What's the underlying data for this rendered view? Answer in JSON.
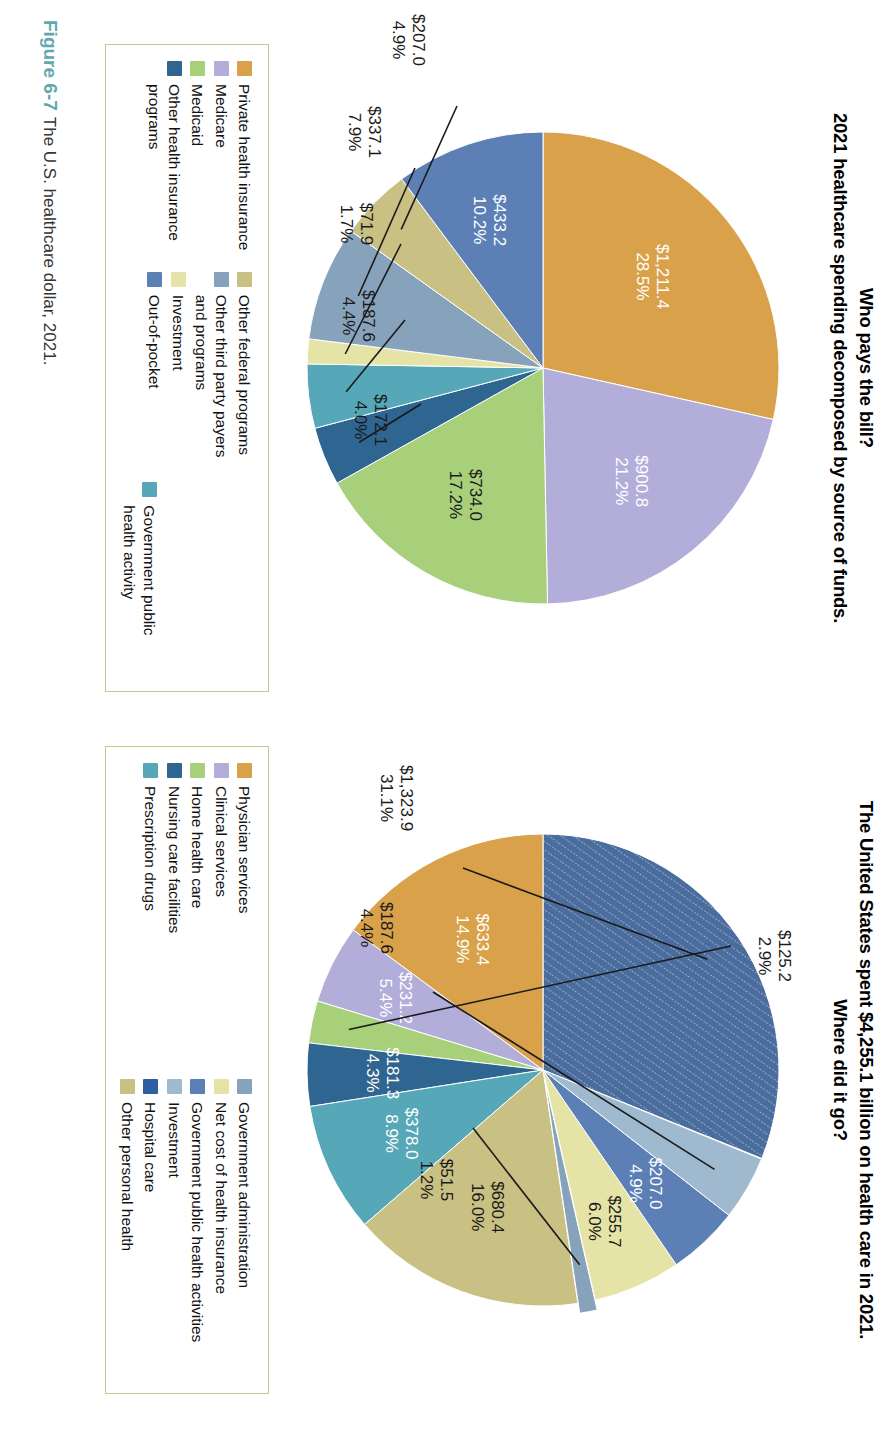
{
  "figure": {
    "number": "Figure 6-7",
    "caption": "The U.S. healthcare dollar, 2021."
  },
  "left_panel": {
    "title_line1": "Who pays the bill?",
    "title_line2": "2021 healthcare spending decomposed by source of funds.",
    "legend": {
      "column1": [
        {
          "label": "Private health insurance",
          "color": "#d9a14a"
        },
        {
          "label": "Medicare",
          "color": "#b3adda"
        },
        {
          "label": "Medicaid",
          "color": "#a8d07a"
        },
        {
          "label": "Other health insurance\nprograms",
          "color": "#2e6591"
        }
      ],
      "column2": [
        {
          "label": "Other federal programs",
          "color": "#c9c083"
        },
        {
          "label": "Other third party payers\nand programs",
          "color": "#87a2bb"
        },
        {
          "label": "Investment",
          "color": "#e5e3a6"
        },
        {
          "label": "Out-of-pocket",
          "color": "#5c7fb5"
        }
      ],
      "column3": [
        {
          "label": "Government public health activity",
          "color": "#56a8b8"
        }
      ]
    }
  },
  "right_panel": {
    "title_line1": "The United States spent $4,255.1 billion on health care in 2021.",
    "title_line2": "Where did it go?",
    "legend": {
      "column1": [
        {
          "label": "Physician services",
          "color": "#d9a14a"
        },
        {
          "label": "Clinical services",
          "color": "#b3adda"
        },
        {
          "label": "Home health care",
          "color": "#a8d07a"
        },
        {
          "label": "Nursing care facilities",
          "color": "#2e6591"
        },
        {
          "label": "Prescription drugs",
          "color": "#56a8b8"
        }
      ],
      "column2": [
        {
          "label": "Government administration",
          "color": "#87a2bb"
        },
        {
          "label": "Net cost of health insurance",
          "color": "#e5e3a6"
        },
        {
          "label": "Government public health activities",
          "color": "#5c7fb5"
        },
        {
          "label": "Investment",
          "color": "#9fb9cf"
        },
        {
          "label": "Hospital care",
          "color": "#2f5fa3"
        },
        {
          "label": "Other personal health",
          "color": "#c9c083"
        }
      ]
    }
  },
  "chart_data": [
    {
      "type": "pie",
      "id": "who-pays-the-bill",
      "title": "Who pays the bill? 2021 healthcare spending decomposed by source of funds.",
      "total": 4255.1,
      "units": "billions of dollars",
      "legend_position": "bottom",
      "categories": [
        "Private health insurance",
        "Medicare",
        "Medicaid",
        "Other health insurance programs",
        "Government public health activity",
        "Investment",
        "Other third party payers and programs",
        "Other federal programs",
        "Out-of-pocket"
      ],
      "values": [
        1211.4,
        900.8,
        734.0,
        172.1,
        187.6,
        71.9,
        337.1,
        207.0,
        433.2
      ],
      "percents": [
        28.5,
        21.2,
        17.2,
        4.0,
        4.4,
        1.7,
        7.9,
        4.9,
        10.2
      ],
      "value_labels": [
        "$1,211.4",
        "$900.8",
        "$734.0",
        "$172.1",
        "$187.6",
        "$71.9",
        "$337.1",
        "$207.0",
        "$433.2"
      ],
      "percent_labels": [
        "28.5%",
        "21.2%",
        "17.2%",
        "4.0%",
        "4.4%",
        "1.7%",
        "7.9%",
        "4.9%",
        "10.2%"
      ],
      "colors": [
        "#d9a14a",
        "#b3adda",
        "#a8d07a",
        "#2e6591",
        "#56a8b8",
        "#e5e3a6",
        "#87a2bb",
        "#c9c083",
        "#5c7fb5"
      ]
    },
    {
      "type": "pie",
      "id": "where-did-it-go",
      "title": "The United States spent $4,255.1 billion on health care in 2021. Where did it go?",
      "total": 4255.1,
      "units": "billions of dollars",
      "legend_position": "bottom",
      "categories": [
        "Hospital care",
        "Physician services",
        "Clinical services",
        "Home health care",
        "Nursing care facilities",
        "Prescription drugs",
        "Other personal health",
        "Government public health activities",
        "Government administration",
        "Net cost of health insurance",
        "Investment"
      ],
      "values": [
        1323.9,
        633.4,
        231.2,
        125.2,
        181.3,
        378.0,
        680.4,
        51.5,
        255.7,
        207.0,
        187.6
      ],
      "percents": [
        31.1,
        14.9,
        5.4,
        2.9,
        4.3,
        8.9,
        16.0,
        1.2,
        6.0,
        4.9,
        4.4
      ],
      "value_labels": [
        "$1,323.9",
        "$633.4",
        "$231.2",
        "$125.2",
        "$181.3",
        "$378.0",
        "$680.4",
        "$51.5",
        "$255.7",
        "$207.0",
        "$187.6"
      ],
      "percent_labels": [
        "31.1%",
        "14.9%",
        "5.4%",
        "2.9%",
        "4.3%",
        "8.9%",
        "16.0%",
        "1.2%",
        "6.0%",
        "4.9%",
        "4.4%"
      ],
      "colors": [
        "#4b6d9e",
        "#d9a14a",
        "#b3adda",
        "#a8d07a",
        "#2e6591",
        "#56a8b8",
        "#c9c083",
        "#87a2bb",
        "#e5e3a6",
        "#5c7fb5",
        "#9fb9cf"
      ]
    }
  ],
  "left_pie_render": {
    "slices": [
      {
        "name": "Private health insurance",
        "color": "#d9a14a",
        "start": -90,
        "end": 12.6,
        "inside": true,
        "l1": "$1,211.4",
        "l2": "28.5%",
        "text": "light",
        "lr": 0.62
      },
      {
        "name": "Medicare",
        "color": "#b3adda",
        "start": 12.6,
        "end": 88.9,
        "inside": true,
        "l1": "$900.8",
        "l2": "21.2%",
        "text": "light",
        "lr": 0.62
      },
      {
        "name": "Medicaid",
        "color": "#a8d07a",
        "start": 88.9,
        "end": 150.8,
        "inside": true,
        "l1": "$734.0",
        "l2": "17.2%",
        "text": "dark",
        "lr": 0.62
      },
      {
        "name": "Other health insurance programs",
        "color": "#2e6591",
        "start": 150.8,
        "end": 165.2,
        "inside": false,
        "l1": "$172.1",
        "l2": "4.0%",
        "lx": 356,
        "ly": 372,
        "tx": 372,
        "ty": 418
      },
      {
        "name": "Government public health activity",
        "color": "#56a8b8",
        "start": 165.2,
        "end": 181.0,
        "inside": false,
        "l1": "$187.6",
        "l2": "4.4%",
        "lx": 272,
        "ly": 388,
        "tx": 268,
        "ty": 430
      },
      {
        "name": "Investment",
        "color": "#e5e3a6",
        "start": 181.0,
        "end": 187.1,
        "inside": false,
        "l1": "$71.9",
        "l2": "1.7%",
        "lx": 196,
        "ly": 392,
        "tx": 176,
        "ty": 432
      },
      {
        "name": "Other third party payers and programs",
        "color": "#87a2bb",
        "start": 187.1,
        "end": 215.5,
        "inside": false,
        "l1": "$337.1",
        "l2": "7.9%",
        "lx": 120,
        "ly": 378,
        "tx": 84,
        "ty": 424
      },
      {
        "name": "Other federal programs",
        "color": "#c9c083",
        "start": 215.5,
        "end": 233.2,
        "inside": false,
        "l1": "$207.0",
        "l2": "4.9%",
        "lx": 58,
        "ly": 336,
        "tx": -8,
        "ty": 380
      },
      {
        "name": "Out-of-pocket",
        "color": "#5c7fb5",
        "start": 233.2,
        "end": 270.0,
        "inside": true,
        "l1": "$433.2",
        "l2": "10.2%",
        "text": "light",
        "lr": 0.66
      }
    ]
  },
  "right_pie_render": {
    "slices": [
      {
        "name": "Hospital care",
        "color": "#4b6d9e",
        "start": -90,
        "end": 22.0,
        "inside": false,
        "l1": "$1,323.9",
        "l2": "31.1%",
        "lx": 118,
        "ly": 330,
        "tx": 48,
        "ty": 392,
        "hatch": true
      },
      {
        "name": "Physician services",
        "color": "#d9a14a",
        "start": -90,
        "end": -143.6,
        "reverse": true,
        "inside": true,
        "l1": "$633.4",
        "l2": "14.9%",
        "text": "light",
        "lr": 0.62
      },
      {
        "name": "Clinical services",
        "color": "#b3adda",
        "start": -143.6,
        "end": -163.0,
        "reverse": true,
        "inside": true,
        "l1": "$231.2",
        "l2": "5.4%",
        "text": "light",
        "lr": 0.68
      },
      {
        "name": "Home health care",
        "color": "#a8d07a",
        "start": -163.0,
        "end": -173.4,
        "reverse": true,
        "inside": false,
        "l1": "$125.2",
        "l2": "2.9%",
        "lx": 196,
        "ly": 62,
        "tx": 206,
        "ty": 14
      },
      {
        "name": "Nursing care facilities",
        "color": "#2e6591",
        "start": -173.4,
        "end": -188.9,
        "reverse": true,
        "inside": true,
        "l1": "$181.3",
        "l2": "4.3%",
        "text": "light",
        "lr": 0.66
      },
      {
        "name": "Prescription drugs",
        "color": "#56a8b8",
        "start": -188.9,
        "end": -220.9,
        "reverse": true,
        "inside": true,
        "l1": "$378.0",
        "l2": "8.9%",
        "text": "light",
        "lr": 0.64
      },
      {
        "name": "Other personal health",
        "color": "#c9c083",
        "start": -220.9,
        "end": -278.5,
        "reverse": true,
        "inside": true,
        "l1": "$680.4",
        "l2": "16.0%",
        "text": "dark",
        "lr": 0.62
      },
      {
        "name": "Government public health activities",
        "color": "#87a2bb",
        "start": -278.5,
        "end": -282.8,
        "reverse": true,
        "inside": false,
        "l1": "$51.5",
        "l2": "1.2%",
        "lx": 378,
        "ly": 320,
        "tx": 430,
        "ty": 352,
        "explode": 10
      },
      {
        "name": "Government administration",
        "color": "#e5e3a6",
        "start": -282.8,
        "end": -304.4,
        "reverse": true,
        "inside": true,
        "l1": "$255.7",
        "l2": "6.0%",
        "text": "dark",
        "lr": 0.7
      },
      {
        "name": "Net cost of health insurance",
        "color": "#5c7fb5",
        "start": -304.4,
        "end": -322.0,
        "reverse": true,
        "inside": true,
        "l1": "$207.0",
        "l2": "4.9%",
        "text": "light",
        "lr": 0.66
      },
      {
        "name": "Investment",
        "color": "#9fb9cf",
        "start": -322.0,
        "end": -337.8,
        "reverse": true,
        "inside": false,
        "l1": "$187.6",
        "l2": "4.4%",
        "lx": 242,
        "ly": 360,
        "tx": 178,
        "ty": 412
      }
    ]
  }
}
